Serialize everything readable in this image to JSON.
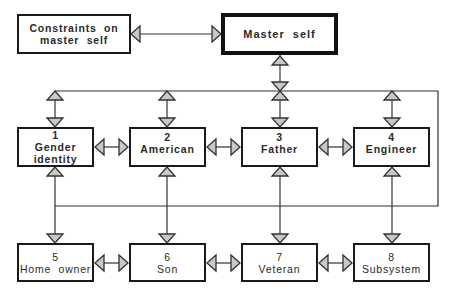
{
  "diagram": {
    "type": "hierarchical identity system diagram",
    "colors": {
      "line": "#333333",
      "arrowhead_fill": "#c8c8c8",
      "box_border": "#1a1a1a",
      "background": "#ffffff"
    },
    "top": {
      "constraints": {
        "label_line1": "Constraints  on",
        "label_line2": "master  self"
      },
      "master": {
        "label": "Master  self"
      }
    },
    "row1": [
      {
        "number": "1",
        "label_line1": "Gender",
        "label_line2": "identity"
      },
      {
        "number": "2",
        "label_line1": "American",
        "label_line2": ""
      },
      {
        "number": "3",
        "label_line1": "Father",
        "label_line2": ""
      },
      {
        "number": "4",
        "label_line1": "Engineer",
        "label_line2": ""
      }
    ],
    "row2": [
      {
        "number": "5",
        "label_line1": "Home  owner"
      },
      {
        "number": "6",
        "label_line1": "Son"
      },
      {
        "number": "7",
        "label_line1": "Veteran"
      },
      {
        "number": "8",
        "label_line1": "Subsystem"
      }
    ],
    "edges": [
      {
        "from": "Constraints on master self",
        "to": "Master self",
        "style": "bidirectional"
      },
      {
        "from": "Master self",
        "to": "upper bus",
        "style": "bidirectional"
      },
      {
        "from": "upper bus",
        "to": "1 Gender identity",
        "style": "bidirectional"
      },
      {
        "from": "upper bus",
        "to": "2 American",
        "style": "bidirectional"
      },
      {
        "from": "upper bus",
        "to": "3 Father",
        "style": "bidirectional"
      },
      {
        "from": "upper bus",
        "to": "4 Engineer",
        "style": "bidirectional"
      },
      {
        "from": "1 Gender identity",
        "to": "2 American",
        "style": "bidirectional"
      },
      {
        "from": "2 American",
        "to": "3 Father",
        "style": "bidirectional"
      },
      {
        "from": "3 Father",
        "to": "4 Engineer",
        "style": "bidirectional"
      },
      {
        "from": "lower bus",
        "to": "5 Home owner",
        "style": "arrow-down"
      },
      {
        "from": "lower bus",
        "to": "6 Son",
        "style": "arrow-down"
      },
      {
        "from": "lower bus",
        "to": "7 Veteran",
        "style": "arrow-down"
      },
      {
        "from": "lower bus",
        "to": "8 Subsystem",
        "style": "arrow-down"
      },
      {
        "from": "5 Home owner",
        "to": "6 Son",
        "style": "bidirectional"
      },
      {
        "from": "6 Son",
        "to": "7 Veteran",
        "style": "bidirectional"
      },
      {
        "from": "7 Veteran",
        "to": "8 Subsystem",
        "style": "bidirectional"
      }
    ]
  }
}
